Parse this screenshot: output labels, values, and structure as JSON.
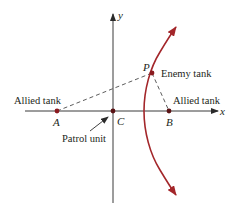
{
  "diagram": {
    "type": "coordinate-diagram",
    "axes": {
      "x_label": "x",
      "y_label": "y"
    },
    "points": {
      "A": {
        "label": "A",
        "caption": "Allied tank"
      },
      "B": {
        "label": "B",
        "caption": "Allied tank"
      },
      "C": {
        "label": "C",
        "caption": "Patrol unit"
      },
      "P": {
        "label": "P",
        "caption": "Enemy tank"
      }
    },
    "colors": {
      "curve": "#a3262a",
      "points": "#8b1a1f",
      "axes": "#3a3a3a",
      "dashed": "#4a4a4a",
      "text": "#231f20"
    }
  }
}
